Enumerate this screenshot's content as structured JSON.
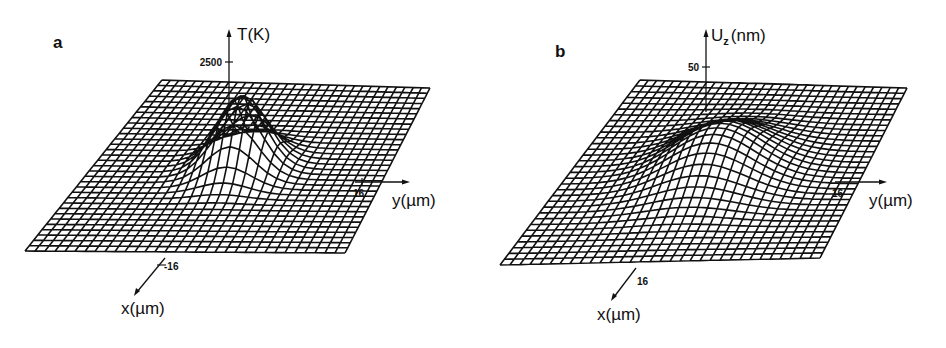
{
  "figure": {
    "panels": [
      {
        "letter": "a",
        "z_axis_label": "T(K)",
        "z_tick": "2500",
        "y_axis_label": "y(µm)",
        "y_tick": "16",
        "x_axis_label": "x(µm)",
        "x_tick": "-16"
      },
      {
        "letter": "b",
        "z_axis_label_main": "U",
        "z_axis_label_sub": "z",
        "z_axis_label_unit": "(nm)",
        "z_tick": "50",
        "y_axis_label": "y(µm)",
        "y_tick": "16",
        "x_axis_label": "x(µm)",
        "x_tick": "16"
      }
    ],
    "colors": {
      "line": "#111111",
      "background": "#ffffff"
    }
  },
  "chart_data": [
    {
      "type": "surface",
      "panel": "a",
      "title": "",
      "xlabel": "x(µm)",
      "ylabel": "y(µm)",
      "zlabel": "T(K)",
      "x_range": [
        -16,
        16
      ],
      "y_range": [
        -16,
        16
      ],
      "z_ticks": [
        2500
      ],
      "grid": "wireframe ~32x32",
      "description": "Sharp Gaussian-like temperature peak centered at origin, peak ≈ 2500 K, narrow width"
    },
    {
      "type": "surface",
      "panel": "b",
      "title": "",
      "xlabel": "x(µm)",
      "ylabel": "y(µm)",
      "zlabel": "Uz(nm)",
      "x_range": [
        -16,
        16
      ],
      "y_range": [
        -16,
        16
      ],
      "z_ticks": [
        50
      ],
      "grid": "wireframe ~32x32",
      "description": "Broader displacement bump centered at origin, peak ≈ 50 nm, wider than temperature peak"
    }
  ]
}
